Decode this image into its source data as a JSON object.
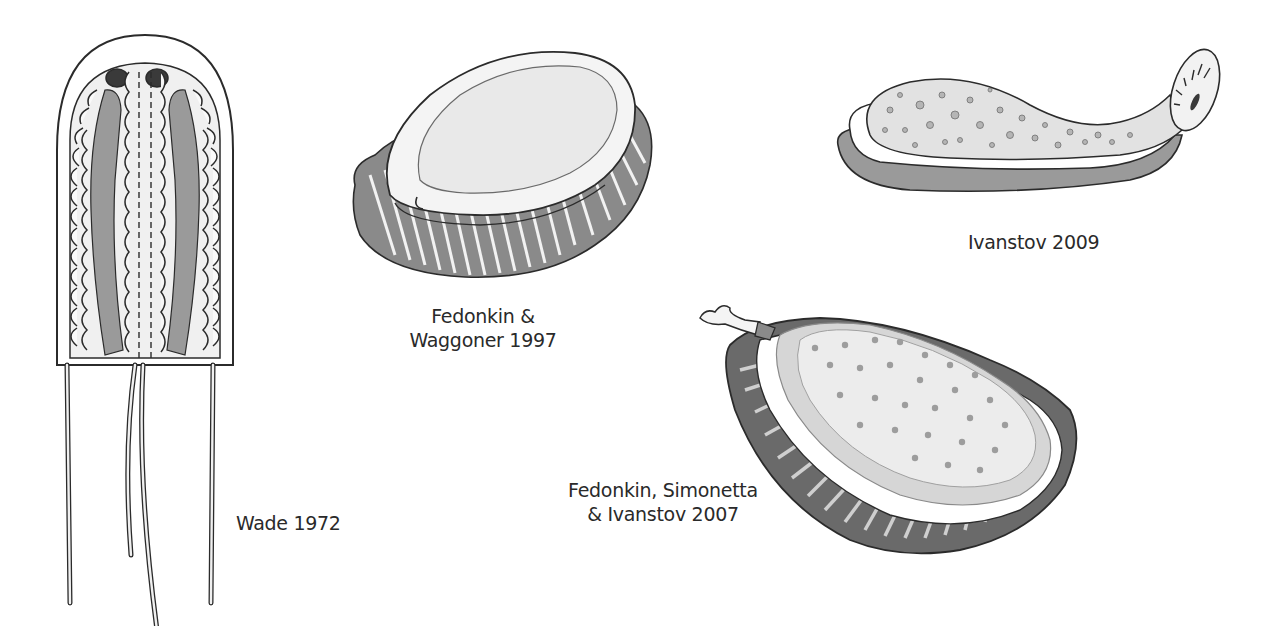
{
  "figures": [
    {
      "id": "wade",
      "label_lines": [
        "Wade 1972"
      ],
      "description": "Elongate sac-like body with two dark eyespots, scalloped margins, gray lateral bands, dashed median line and four trailing tentacles"
    },
    {
      "id": "fedonkin-waggoner",
      "label_lines": [
        "Fedonkin &",
        "Waggoner 1997"
      ],
      "description": "Oval shell-like dorsal body with frilled, pleated ventral margin"
    },
    {
      "id": "ivanstov",
      "label_lines": [
        "Ivanstov 2009"
      ],
      "description": "Elongate slug-like body with dotted dorsal surface, gray foot and oval proboscis disc with radial teeth"
    },
    {
      "id": "fedonkin-simonetta-ivanstov",
      "label_lines": [
        "Fedonkin, Simonetta",
        "& Ivanstov 2007"
      ],
      "description": "Domed oval body with dotted surface, striated rim, frilled gray margin and short anterior proboscis"
    }
  ],
  "colors": {
    "background": "#ffffff",
    "outline": "#2b2b2b",
    "light_fill": "#f1f1f1",
    "mid_gray": "#9a9a9a",
    "dark_gray": "#5a5a5a",
    "eye": "#3a3a3a",
    "text": "#2a2a2a"
  }
}
